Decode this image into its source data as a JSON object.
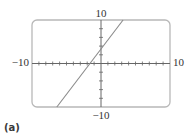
{
  "caption": "(a)",
  "colors": {
    "frame": "#b8b8b8",
    "axes": "#666666",
    "line": "#8a8a8a",
    "text": "#333333"
  },
  "chart_data": {
    "type": "line",
    "title": "",
    "xlabel": "",
    "ylabel": "",
    "xlim": [
      -10,
      10
    ],
    "ylim": [
      -10,
      10
    ],
    "tick_labels": {
      "x_min": "−10",
      "x_max": "10",
      "y_min": "−10",
      "y_max": "10"
    },
    "x_tick_step": 1,
    "y_tick_step": 2,
    "grid": false,
    "legend": null,
    "series": [
      {
        "name": "line",
        "x": [
          -6.4,
          3.2
        ],
        "y": [
          -10,
          10
        ],
        "approx_equation": "y ≈ 2x + 3.5"
      }
    ]
  }
}
